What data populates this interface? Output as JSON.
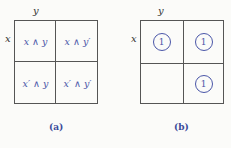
{
  "diagram_a": {
    "label_y": "y",
    "label_x": "x",
    "cells": [
      "x ∧ y",
      "x ∧ y′",
      "x′ ∧ y",
      "x′ ∧ y′"
    ],
    "caption": "(a)"
  },
  "diagram_b": {
    "label_y": "y",
    "label_x": "x",
    "cells": [
      "1",
      "1",
      "",
      "1"
    ],
    "caption": "(b)"
  },
  "colors": {
    "accent": "#4a56a8",
    "line": "#555555"
  }
}
